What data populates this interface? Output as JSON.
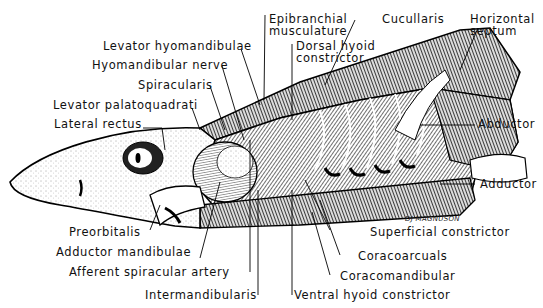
{
  "figure": {
    "signature": "DJ MAGNUSON",
    "labels": {
      "epibranchial": [
        "Epibranchial",
        "musculature"
      ],
      "cucullaris": "Cucullaris",
      "horizontal_septum": [
        "Horizontal",
        "septum"
      ],
      "levator_hyomandibulae": "Levator hyomandibulae",
      "dorsal_hyoid": [
        "Dorsal hyoid",
        "constrictor"
      ],
      "hyomandibular_nerve": "Hyomandibular nerve",
      "spiracularis": "Spiracularis",
      "levator_palatoquadrati": "Levator palatoquadrati",
      "lateral_rectus": "Lateral rectus",
      "abductor": "Abductor",
      "adductor": "Adductor",
      "preorbitalis": "Preorbitalis",
      "superficial_constrictor": "Superficial constrictor",
      "adductor_mandibulae": "Adductor mandibulae",
      "coracoarcuals": "Coracoarcuals",
      "afferent_spiracular_artery": "Afferent spiracular artery",
      "coracomandibular": "Coracomandibular",
      "intermandibularis": "Intermandibularis",
      "ventral_hyoid": "Ventral hyoid constrictor"
    }
  }
}
